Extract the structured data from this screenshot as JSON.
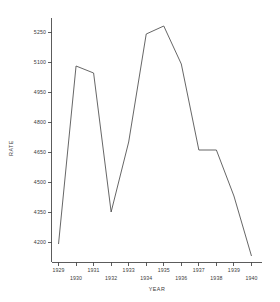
{
  "chart_data": {
    "type": "line",
    "title": "",
    "xlabel": "YEAR",
    "ylabel": "RATE",
    "x": [
      1929,
      1930,
      1931,
      1932,
      1933,
      1934,
      1935,
      1936,
      1937,
      1938,
      1939,
      1940
    ],
    "values": [
      4190,
      5080,
      5045,
      4350,
      4700,
      5240,
      5280,
      5090,
      4660,
      4660,
      4430,
      4130
    ],
    "series": [
      {
        "name": "RATE",
        "values": [
          4190,
          5080,
          5045,
          4350,
          4700,
          5240,
          5280,
          5090,
          4660,
          4660,
          4430,
          4130
        ]
      }
    ],
    "xtick_labels": [
      "1929",
      "1930",
      "1931",
      "1932",
      "1933",
      "1934",
      "1935",
      "1936",
      "1937",
      "1938",
      "1939",
      "1940"
    ],
    "ytick_labels": [
      "4200",
      "4350",
      "4500",
      "4650",
      "4800",
      "4950",
      "5100",
      "5250"
    ],
    "ytick_values": [
      4200,
      4350,
      4500,
      4650,
      4800,
      4950,
      5100,
      5250
    ],
    "xlim": [
      1928.6,
      1940.6
    ],
    "ylim": [
      4100,
      5320
    ],
    "grid": false,
    "legend": "none",
    "line_color": "#4a4a4a",
    "axis_color": "#4a4a4a",
    "background_color": "#ffffff"
  },
  "axes": {
    "y_title": "RATE",
    "x_title": "YEAR"
  }
}
